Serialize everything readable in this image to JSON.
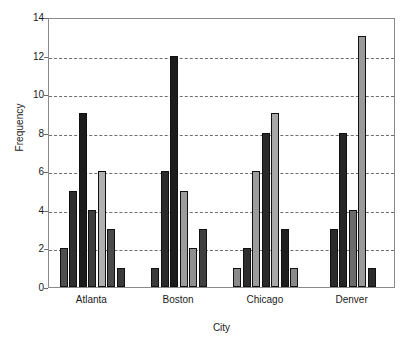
{
  "chart_data": {
    "type": "bar",
    "title": "",
    "xlabel": "City",
    "ylabel": "Frequency",
    "categories": [
      "Atlanta",
      "Boston",
      "Chicago",
      "Denver"
    ],
    "ylim": [
      0,
      14
    ],
    "yticks": [
      0,
      2,
      4,
      6,
      8,
      10,
      12,
      14
    ],
    "ytick_labels": [
      "0",
      "2",
      "4",
      "6",
      "8",
      "10",
      "12",
      "14"
    ],
    "grid": true,
    "grid_style": "dashed horizontal",
    "legend": "none",
    "groups": [
      {
        "category": "Atlanta",
        "bars": [
          {
            "value": 2,
            "color": "#4f4f4f"
          },
          {
            "value": 5,
            "color": "#2e2e2e"
          },
          {
            "value": 9,
            "color": "#1c1c1c"
          },
          {
            "value": 4,
            "color": "#3d3d3d"
          },
          {
            "value": 6,
            "color": "#b0b0b0"
          },
          {
            "value": 3,
            "color": "#4a4a4a"
          },
          {
            "value": 1,
            "color": "#3a3a3a"
          }
        ]
      },
      {
        "category": "Boston",
        "bars": [
          {
            "value": 1,
            "color": "#3a3a3a"
          },
          {
            "value": 6,
            "color": "#2b2b2b"
          },
          {
            "value": 12,
            "color": "#1c1c1c"
          },
          {
            "value": 5,
            "color": "#9c9c9c"
          },
          {
            "value": 2,
            "color": "#8f8f8f"
          },
          {
            "value": 3,
            "color": "#3f3f3f"
          }
        ]
      },
      {
        "category": "Chicago",
        "bars": [
          {
            "value": 1,
            "color": "#8a8a8a"
          },
          {
            "value": 2,
            "color": "#2e2e2e"
          },
          {
            "value": 6,
            "color": "#9c9c9c"
          },
          {
            "value": 8,
            "color": "#2a2a2a"
          },
          {
            "value": 9,
            "color": "#a8a8a8"
          },
          {
            "value": 3,
            "color": "#1f1f1f"
          },
          {
            "value": 1,
            "color": "#8a8a8a"
          }
        ]
      },
      {
        "category": "Denver",
        "bars": [
          {
            "value": 3,
            "color": "#2a2a2a"
          },
          {
            "value": 8,
            "color": "#262626"
          },
          {
            "value": 4,
            "color": "#6b6b6b"
          },
          {
            "value": 13,
            "color": "#9a9a9a"
          },
          {
            "value": 1,
            "color": "#2b2b2b"
          }
        ]
      }
    ]
  },
  "colors": {
    "axis": "#8a8a8a",
    "grid": "#6f6f6f",
    "text": "#1a1a1a",
    "background": "#ffffff"
  }
}
